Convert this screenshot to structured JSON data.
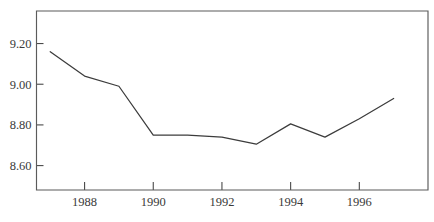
{
  "chart_data": {
    "type": "line",
    "title": "",
    "subtitle": "",
    "xlabel": "",
    "ylabel": "",
    "xlim": [
      1986.6,
      1998.0
    ],
    "ylim": [
      8.48,
      9.36
    ],
    "grid": false,
    "legend": null,
    "annotations": [],
    "x": [
      1987,
      1988,
      1989,
      1990,
      1991,
      1992,
      1993,
      1994,
      1995,
      1996,
      1997
    ],
    "series": [
      {
        "name": "series-1",
        "color": "#3c3c3c",
        "values": [
          9.16,
          9.04,
          8.99,
          8.75,
          8.75,
          8.74,
          8.705,
          8.805,
          8.74,
          8.83,
          8.93
        ]
      }
    ],
    "y_ticks": [
      8.6,
      8.8,
      9.0,
      9.2
    ],
    "y_tick_labels": [
      "8.60",
      "8.80",
      "9.00",
      "9.20"
    ],
    "x_ticks": [
      1988,
      1990,
      1992,
      1994,
      1996
    ],
    "x_tick_labels": [
      "1988",
      "1990",
      "1992",
      "1994",
      "1996"
    ],
    "colors": {
      "line": "#3c3c3c",
      "frame": "#5b5b5b",
      "text": "#3a3a3a",
      "background": "#ffffff"
    }
  }
}
